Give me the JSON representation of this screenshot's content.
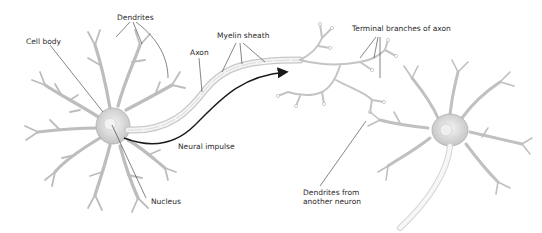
{
  "diagram": {
    "type": "neuron-anatomy",
    "labels": {
      "dendrites": "Dendrites",
      "cell_body": "Cell body",
      "axon": "Axon",
      "myelin_sheath": "Myelin sheath",
      "terminal_branches": "Terminal branches of axon",
      "neural_impulse": "Neural impulse",
      "nucleus": "Nucleus",
      "dendrites_from_another_line1": "Dendrites from",
      "dendrites_from_another_line2": "another neuron"
    },
    "colors": {
      "neuron_stroke": "#b8b8b8",
      "neuron_fill": "#e9e9e9",
      "leader_line": "#333333",
      "impulse_arrow": "#1a1a1a",
      "text": "#2a2a2a"
    }
  }
}
